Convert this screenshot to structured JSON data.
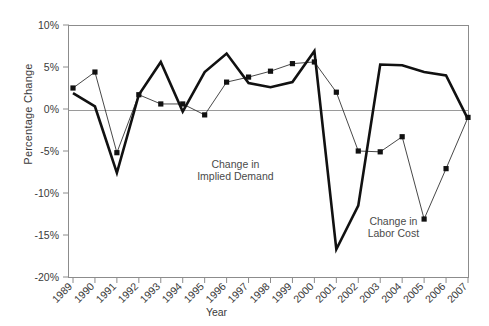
{
  "chart_data": {
    "type": "line",
    "title": "",
    "xlabel": "Year",
    "ylabel": "Percentage Change",
    "ylim": [
      -20,
      10
    ],
    "ytick_labels": [
      "10%",
      "5%",
      "0%",
      "-5%",
      "-10%",
      "-15%",
      "-20%"
    ],
    "ytick_values": [
      10,
      5,
      0,
      -5,
      -10,
      -15,
      -20
    ],
    "grid": false,
    "legend": "annotations-inline",
    "categories": [
      "1989",
      "1990",
      "1991",
      "1992",
      "1993",
      "1994",
      "1995",
      "1996",
      "1997",
      "1998",
      "1999",
      "2000",
      "2001",
      "2002",
      "2003",
      "2004",
      "2005",
      "2006",
      "2007"
    ],
    "x": [
      1989,
      1990,
      1991,
      1992,
      1993,
      1994,
      1995,
      1996,
      1997,
      1998,
      1999,
      2000,
      2001,
      2002,
      2003,
      2004,
      2005,
      2006,
      2007
    ],
    "series": [
      {
        "name": "Change in Implied Demand",
        "style": "thick-line-no-marker",
        "values": [
          1.9,
          0.3,
          -7.6,
          1.7,
          5.6,
          -0.3,
          4.4,
          6.6,
          3.1,
          2.6,
          3.2,
          6.9,
          -16.7,
          -11.5,
          5.3,
          5.2,
          4.4,
          4.0,
          -1.2
        ]
      },
      {
        "name": "Change in Labor Cost",
        "style": "thin-line-square-marker",
        "values": [
          2.5,
          4.4,
          -5.2,
          1.7,
          0.6,
          0.6,
          -0.7,
          3.2,
          3.8,
          4.5,
          5.4,
          5.6,
          2.0,
          -5.0,
          -5.1,
          -3.3,
          -13.1,
          -7.1,
          -1.0
        ]
      }
    ],
    "annotations": [
      {
        "name": "implied-demand-label",
        "text_line1": "Change in",
        "text_line2": "Implied Demand",
        "x": 1996.4,
        "y": -7.0
      },
      {
        "name": "labor-cost-label",
        "text_line1": "Change in",
        "text_line2": "Labor Cost",
        "x": 2003.6,
        "y": -13.8
      }
    ],
    "colors": {
      "series_1": "#111111",
      "series_2": "#333333",
      "axis": "#8c8c8c",
      "text": "#3a3a3a"
    }
  }
}
